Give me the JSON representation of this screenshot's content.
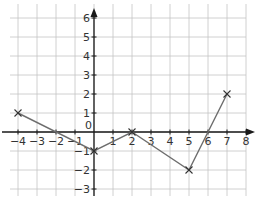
{
  "chart_data": {
    "type": "line",
    "title": "",
    "xlabel": "",
    "ylabel": "",
    "xlim": [
      -4.4,
      8.2
    ],
    "ylim": [
      -3.3,
      6.5
    ],
    "grid": true,
    "x_ticks": [
      -4,
      -3,
      -2,
      -1,
      0,
      1,
      2,
      3,
      4,
      5,
      6,
      7,
      8
    ],
    "y_ticks": [
      -3,
      -2,
      -1,
      1,
      2,
      3,
      4,
      5,
      6
    ],
    "x_tick_labels": [
      "−4",
      "−3",
      "−2",
      "−1",
      "0",
      "1",
      "2",
      "3",
      "4",
      "5",
      "6",
      "7",
      "8"
    ],
    "y_tick_labels": [
      "−3",
      "−2",
      "−1",
      "1",
      "2",
      "3",
      "4",
      "5",
      "6"
    ],
    "series": [
      {
        "name": "line",
        "marker": "x",
        "color": "#6e6e6e",
        "x": [
          -4,
          0,
          2,
          5,
          7
        ],
        "y": [
          1,
          -1,
          0,
          -2,
          2
        ]
      }
    ],
    "legend": null
  },
  "layout": {
    "origin_px": [
      94,
      132
    ],
    "unit_px": 19,
    "axis_color": "#1a1a1a",
    "grid_color": "#c4c4c4"
  }
}
